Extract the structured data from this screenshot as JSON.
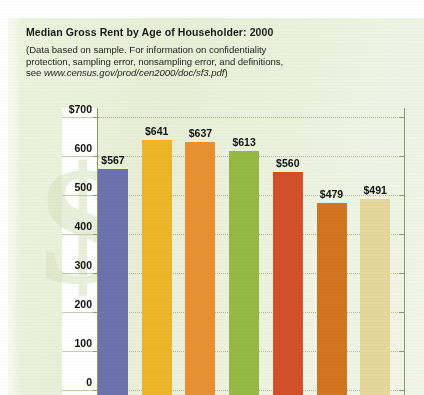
{
  "header": {
    "title": "Median Gross Rent by Age of Householder: 2000",
    "subtitle_line1": "(Data based on sample. For information on confidentiality",
    "subtitle_line2": "protection, sampling error, nonsampling error, and definitions,",
    "subtitle_line3_prefix": "see ",
    "subtitle_url": "www.census.gov/prod/cen2000/doc/sf3.pdf",
    "subtitle_line3_suffix": ")"
  },
  "watermark": {
    "glyph": "$"
  },
  "chart_data": {
    "type": "bar",
    "title": "Median Gross Rent by Age of Householder: 2000",
    "subtitle": "(Data based on sample. For information on confidentiality protection, sampling error, nonsampling error, and definitions, see www.census.gov/prod/cen2000/doc/sf3.pdf)",
    "xlabel": "",
    "ylabel": "",
    "ylim": [
      0,
      700
    ],
    "grid": true,
    "legend": false,
    "categories": [
      "",
      "",
      "",
      "",
      "",
      "",
      ""
    ],
    "values": [
      567,
      641,
      637,
      613,
      560,
      479,
      491
    ],
    "value_labels": [
      "$567",
      "$641",
      "$637",
      "$613",
      "$560",
      "$479",
      "$491"
    ],
    "colors": [
      "#6b72ad",
      "#edb529",
      "#e89132",
      "#94ba43",
      "#d3502a",
      "#d2761f",
      "#e6d79a"
    ],
    "ytick_values": [
      700,
      600,
      500,
      400,
      300,
      200,
      100,
      0
    ],
    "ytick_labels": [
      "$700",
      "600",
      "500",
      "400",
      "300",
      "200",
      "100",
      "0"
    ]
  }
}
